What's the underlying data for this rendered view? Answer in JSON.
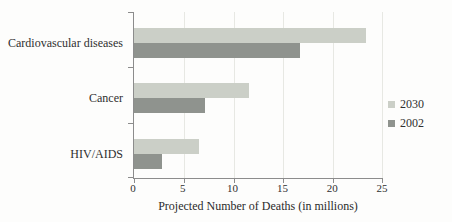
{
  "chart_data": {
    "type": "bar",
    "orientation": "horizontal",
    "title": "",
    "categories": [
      "Cardiovascular diseases",
      "Cancer",
      "HIV/AIDS"
    ],
    "series": [
      {
        "name": "2030",
        "color": "#cbcfc7",
        "values": [
          23.3,
          11.5,
          6.5
        ]
      },
      {
        "name": "2002",
        "color": "#8f938e",
        "values": [
          16.7,
          7.1,
          2.8
        ]
      }
    ],
    "xlabel": "Projected Number of Deaths (in millions)",
    "ylabel": "",
    "xlim": [
      0,
      25
    ],
    "xticks": [
      0,
      5,
      10,
      15,
      20,
      25
    ],
    "grid": "vertical-light",
    "legend_position": "right"
  },
  "colors": {
    "axis": "#8c8c8c",
    "gridline": "#e7e8e3",
    "text": "#2f2f2f",
    "background": "#fdfdfc"
  }
}
